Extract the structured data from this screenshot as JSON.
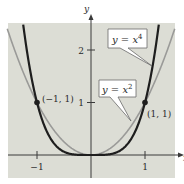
{
  "chart_data": {
    "type": "line",
    "title": "",
    "xlabel": "x",
    "ylabel": "y",
    "xlim": [
      -1.55,
      1.55
    ],
    "ylim": [
      -0.45,
      2.5
    ],
    "grid": false,
    "x_ticks": [
      {
        "value": -1,
        "label": "−1"
      },
      {
        "value": 1,
        "label": "1"
      }
    ],
    "y_ticks": [
      {
        "value": 1,
        "label": "1"
      },
      {
        "value": 2,
        "label": "2"
      }
    ],
    "series": [
      {
        "name": "y = x^4",
        "label_base": "y = x",
        "label_exp": "4",
        "exponent": 4,
        "color": "#1e1e1e",
        "width": 2.2
      },
      {
        "name": "y = x^2",
        "label_base": "y = x",
        "label_exp": "2",
        "exponent": 2,
        "color": "#9a9a98",
        "width": 1.6
      }
    ],
    "points": [
      {
        "x": -1,
        "y": 1,
        "label": "(−1, 1)"
      },
      {
        "x": 1,
        "y": 1,
        "label": "(1, 1)"
      }
    ],
    "annotations": [
      {
        "series": "y = x^4",
        "text": "y = x^4"
      },
      {
        "series": "y = x^2",
        "text": "y = x^2"
      }
    ]
  },
  "style": {
    "plot_bg": "#dcddd5",
    "page_bg": "#ffffff",
    "axis_color": "#3a3a3a"
  }
}
